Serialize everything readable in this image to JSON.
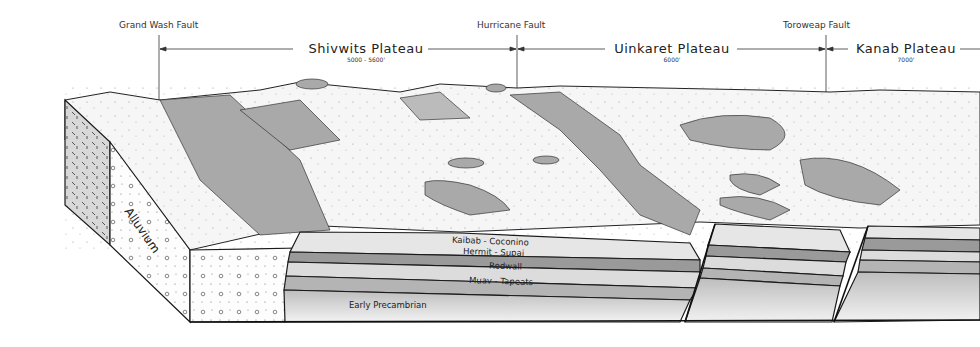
{
  "diagram": {
    "faults": [
      {
        "label": "Grand Wash Fault",
        "x": 159
      },
      {
        "label": "Hurricane Fault",
        "x": 517
      },
      {
        "label": "Toroweap Fault",
        "x": 826
      }
    ],
    "plateaus": [
      {
        "name": "Shivwits Plateau",
        "elevation": "5000 - 5600'"
      },
      {
        "name": "Uinkaret Plateau",
        "elevation": "6000'"
      },
      {
        "name": "Kanab Plateau",
        "elevation": "7000'"
      }
    ],
    "layers": [
      {
        "name": "Kaibab - Coconino",
        "color": "#e6e6e6"
      },
      {
        "name": "Hermit - Supai",
        "color": "#9a9a9a"
      },
      {
        "name": "Redwall",
        "color": "#dcdcdc"
      },
      {
        "name": "Muav - Tapeats",
        "color": "#b4b4b4"
      },
      {
        "name": "Early Precambrian",
        "color": "#c8c8c8"
      }
    ],
    "deposits": {
      "alluvium": "Alluvium"
    },
    "colors": {
      "cliff_shade": "#a8a8a8",
      "plateau_surface": "#f7f7f7",
      "outline": "#1a1a1a"
    }
  }
}
